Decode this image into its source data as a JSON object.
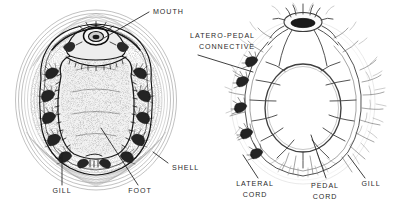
{
  "figure": {
    "kind": "scientific-illustration",
    "background_color": "#ffffff",
    "ink_color": "#2e2e2e",
    "label_color": "#2b2b2b"
  },
  "panels": [
    {
      "id": "ventral-view",
      "name": "chiton-ventral-anatomy",
      "labels": [
        {
          "key": "mouth",
          "text": "MOUTH"
        },
        {
          "key": "shell",
          "text": "SHELL"
        },
        {
          "key": "gill",
          "text": "GILL"
        },
        {
          "key": "foot",
          "text": "FOOT"
        }
      ]
    },
    {
      "id": "nervous-system",
      "name": "chiton-nervous-system",
      "labels": [
        {
          "key": "latero_pedal_connective_line1",
          "text": "LATERO-PEDAL"
        },
        {
          "key": "latero_pedal_connective_line2",
          "text": "CONNECTIVE"
        },
        {
          "key": "lateral_cord_line1",
          "text": "LATERAL"
        },
        {
          "key": "lateral_cord_line2",
          "text": "CORD"
        },
        {
          "key": "pedal_cord_line1",
          "text": "PEDAL"
        },
        {
          "key": "pedal_cord_line2",
          "text": "CORD"
        },
        {
          "key": "gill",
          "text": "GILL"
        }
      ]
    }
  ],
  "left_panel": {
    "mouth_label": "MOUTH",
    "shell_label": "SHELL",
    "gill_label": "GILL",
    "foot_label": "FOOT"
  },
  "right_panel": {
    "latero_pedal_1": "LATERO-PEDAL",
    "latero_pedal_2": "CONNECTIVE",
    "lateral_cord_1": "LATERAL",
    "lateral_cord_2": "CORD",
    "pedal_cord_1": "PEDAL",
    "pedal_cord_2": "CORD",
    "gill_label": "GILL"
  }
}
